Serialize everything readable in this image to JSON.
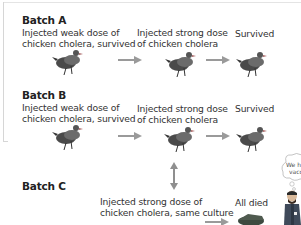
{
  "batches": [
    {
      "title": "Batch A",
      "step1": {
        "line1": "Injected weak dose of",
        "line2": "chicken cholera, survived"
      },
      "step2": {
        "line1": "Injected strong dose",
        "line2": "of chicken cholera"
      },
      "step3": {
        "line1": "Survived"
      }
    },
    {
      "title": "Batch B",
      "step1": {
        "line1": "Injected weak dose of",
        "line2": "chicken cholera, survived"
      },
      "step2": {
        "line1": "Injected strong dose",
        "line2": "of chicken cholera"
      },
      "step3": {
        "line1": "Survived"
      }
    },
    {
      "title": "Batch C",
      "step2": {
        "line1": "Injected strong dose of",
        "line2": "chicken cholera, same culture"
      },
      "step3": {
        "line1": "All died"
      }
    }
  ],
  "speech_bubble": {
    "line1": "We ha",
    "line2": "vacc"
  },
  "colors": {
    "arrow": "#9a9a9a",
    "text": "#2b2b2b",
    "frame": "#d6d6d6"
  }
}
